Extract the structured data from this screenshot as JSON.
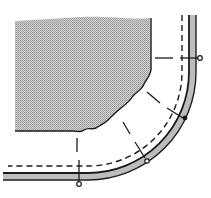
{
  "diagram": {
    "colors": {
      "background": "#ffffff",
      "fabric_fill": "#c8c8c8",
      "fabric_stipple": "#9a9a9a",
      "line": "#1a1a1a",
      "band_fill": "#bdbdbd"
    },
    "elements": {
      "fabric_piece": "fabric-piece",
      "binding_strip": "binding-strip",
      "stitch_line": "dashed-stitch-line",
      "guide_lines": 5,
      "markers": [
        {
          "type": "open-circle",
          "x": 200,
          "y": 58
        },
        {
          "type": "filled-dot",
          "x": 185,
          "y": 117
        },
        {
          "type": "open-circle",
          "x": 147,
          "y": 161
        },
        {
          "type": "open-circle",
          "x": 79,
          "y": 184
        }
      ]
    }
  }
}
